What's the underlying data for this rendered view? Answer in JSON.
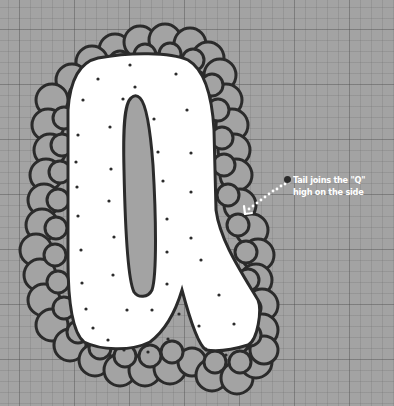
{
  "illustration": {
    "letter": "Q",
    "style": "bubble letter with scalloped outline and polka dots on grid paper",
    "colors": {
      "paper": "#a3a3a3",
      "grid_minor": "#8c8c8c",
      "grid_major": "#7a7a7a",
      "letter_fill": "#ffffff",
      "ink": "#2b2b2b",
      "scallop_fill": "#a3a3a3",
      "arrow": "#ffffff"
    }
  },
  "annotation": {
    "bullet_icon": "bullet-dot",
    "line1": "Tail joins the \"Q\"",
    "line2": "high on the side",
    "arrow_icon": "dotted-arrow-left-down"
  }
}
